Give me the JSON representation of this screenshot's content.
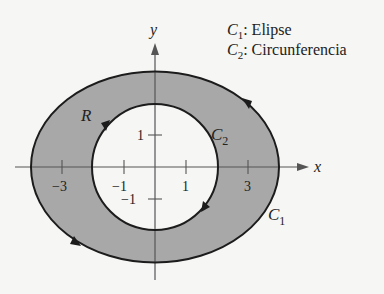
{
  "figure": {
    "legend": [
      {
        "symbol": "C",
        "sub": "1",
        "text": ": Elipse"
      },
      {
        "symbol": "C",
        "sub": "2",
        "text": ": Circunferencia"
      }
    ],
    "axes": {
      "x_label": "x",
      "y_label": "y",
      "x_ticks": [
        {
          "value": -3,
          "label": "−3"
        },
        {
          "value": -1,
          "label": "−1"
        },
        {
          "value": 1,
          "label": "1"
        },
        {
          "value": 3,
          "label": "3"
        }
      ],
      "y_ticks": [
        {
          "value": 1,
          "label": "1"
        },
        {
          "value": -1,
          "label": "−1"
        }
      ]
    },
    "curves": {
      "ellipse": {
        "name": "C",
        "sub": "1",
        "semi_axis_x": 4,
        "semi_axis_y": 3,
        "orientation": "counterclockwise"
      },
      "circle": {
        "name": "C",
        "sub": "2",
        "radius": 2,
        "orientation": "clockwise"
      }
    },
    "region_label": "R",
    "colors": {
      "region_fill": "#a8a8a8",
      "curve_stroke": "#1c1c1c",
      "axis_stroke": "#555555",
      "background": "#f6f6f4"
    }
  }
}
